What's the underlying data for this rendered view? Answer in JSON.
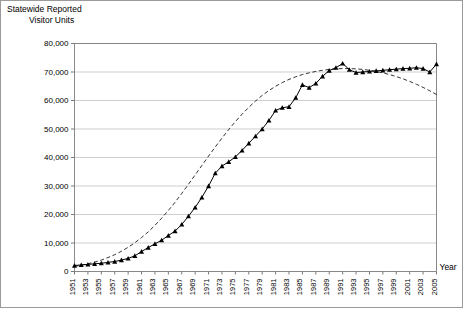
{
  "figure": {
    "title_line1": "Statewide Reported",
    "title_line2": "Visitor Units",
    "x_axis_caption": "Year"
  },
  "chart_data": {
    "type": "line",
    "title": "Statewide Reported Visitor Units",
    "xlabel": "Year",
    "ylabel": "Visitor Units",
    "xlim": [
      1951,
      2005
    ],
    "ylim": [
      0,
      80000
    ],
    "ytick_step": 10000,
    "ytick_labels": [
      "0",
      "10,000",
      "20,000",
      "30,000",
      "40,000",
      "50,000",
      "60,000",
      "70,000",
      "80,000"
    ],
    "ytick_values": [
      0,
      10000,
      20000,
      30000,
      40000,
      50000,
      60000,
      70000,
      80000
    ],
    "xtick_labels": [
      "1951",
      "1953",
      "1955",
      "1957",
      "1959",
      "1961",
      "1963",
      "1965",
      "1967",
      "1969",
      "1971",
      "1973",
      "1975",
      "1977",
      "1979",
      "1981",
      "1983",
      "1985",
      "1987",
      "1989",
      "1991",
      "1993",
      "1995",
      "1997",
      "1999",
      "2001",
      "2003",
      "2005"
    ],
    "grid": "horizontal",
    "legend": "none",
    "x": [
      1951,
      1952,
      1953,
      1954,
      1955,
      1956,
      1957,
      1958,
      1959,
      1960,
      1961,
      1962,
      1963,
      1964,
      1965,
      1966,
      1967,
      1968,
      1969,
      1970,
      1971,
      1972,
      1973,
      1974,
      1975,
      1976,
      1977,
      1978,
      1979,
      1980,
      1981,
      1982,
      1983,
      1984,
      1985,
      1986,
      1987,
      1988,
      1989,
      1990,
      1991,
      1992,
      1993,
      1994,
      1995,
      1996,
      1997,
      1998,
      1999,
      2000,
      2001,
      2002,
      2003,
      2004,
      2005
    ],
    "series": [
      {
        "name": "Reported visitor units",
        "style": "solid-with-triangle-markers",
        "values": [
          2100,
          2300,
          2500,
          2700,
          2900,
          3200,
          3500,
          4000,
          4600,
          5500,
          7000,
          8400,
          9700,
          11000,
          12600,
          14200,
          16500,
          19400,
          22500,
          26000,
          30000,
          34500,
          37000,
          38500,
          40200,
          42500,
          45000,
          47500,
          50000,
          53000,
          56500,
          57500,
          57800,
          61000,
          65500,
          64500,
          66000,
          68500,
          70500,
          71500,
          73000,
          70800,
          69800,
          70000,
          70200,
          70400,
          70600,
          70800,
          71000,
          71200,
          71300,
          71500,
          71200,
          70000,
          72800
        ]
      },
      {
        "name": "Trend (fitted curve)",
        "style": "dashed",
        "values": [
          1800,
          2200,
          2700,
          3300,
          4000,
          4900,
          5900,
          7100,
          8500,
          10100,
          11900,
          13900,
          16200,
          18700,
          21400,
          24300,
          27400,
          30600,
          33900,
          37200,
          40500,
          43700,
          46800,
          49800,
          52600,
          55200,
          57600,
          59800,
          61800,
          63500,
          65000,
          66300,
          67400,
          68300,
          69100,
          69700,
          70200,
          70600,
          70900,
          71100,
          71200,
          71200,
          71100,
          70900,
          70600,
          70200,
          69700,
          69100,
          68400,
          67600,
          66700,
          65700,
          64600,
          63400,
          62100
        ]
      }
    ]
  }
}
